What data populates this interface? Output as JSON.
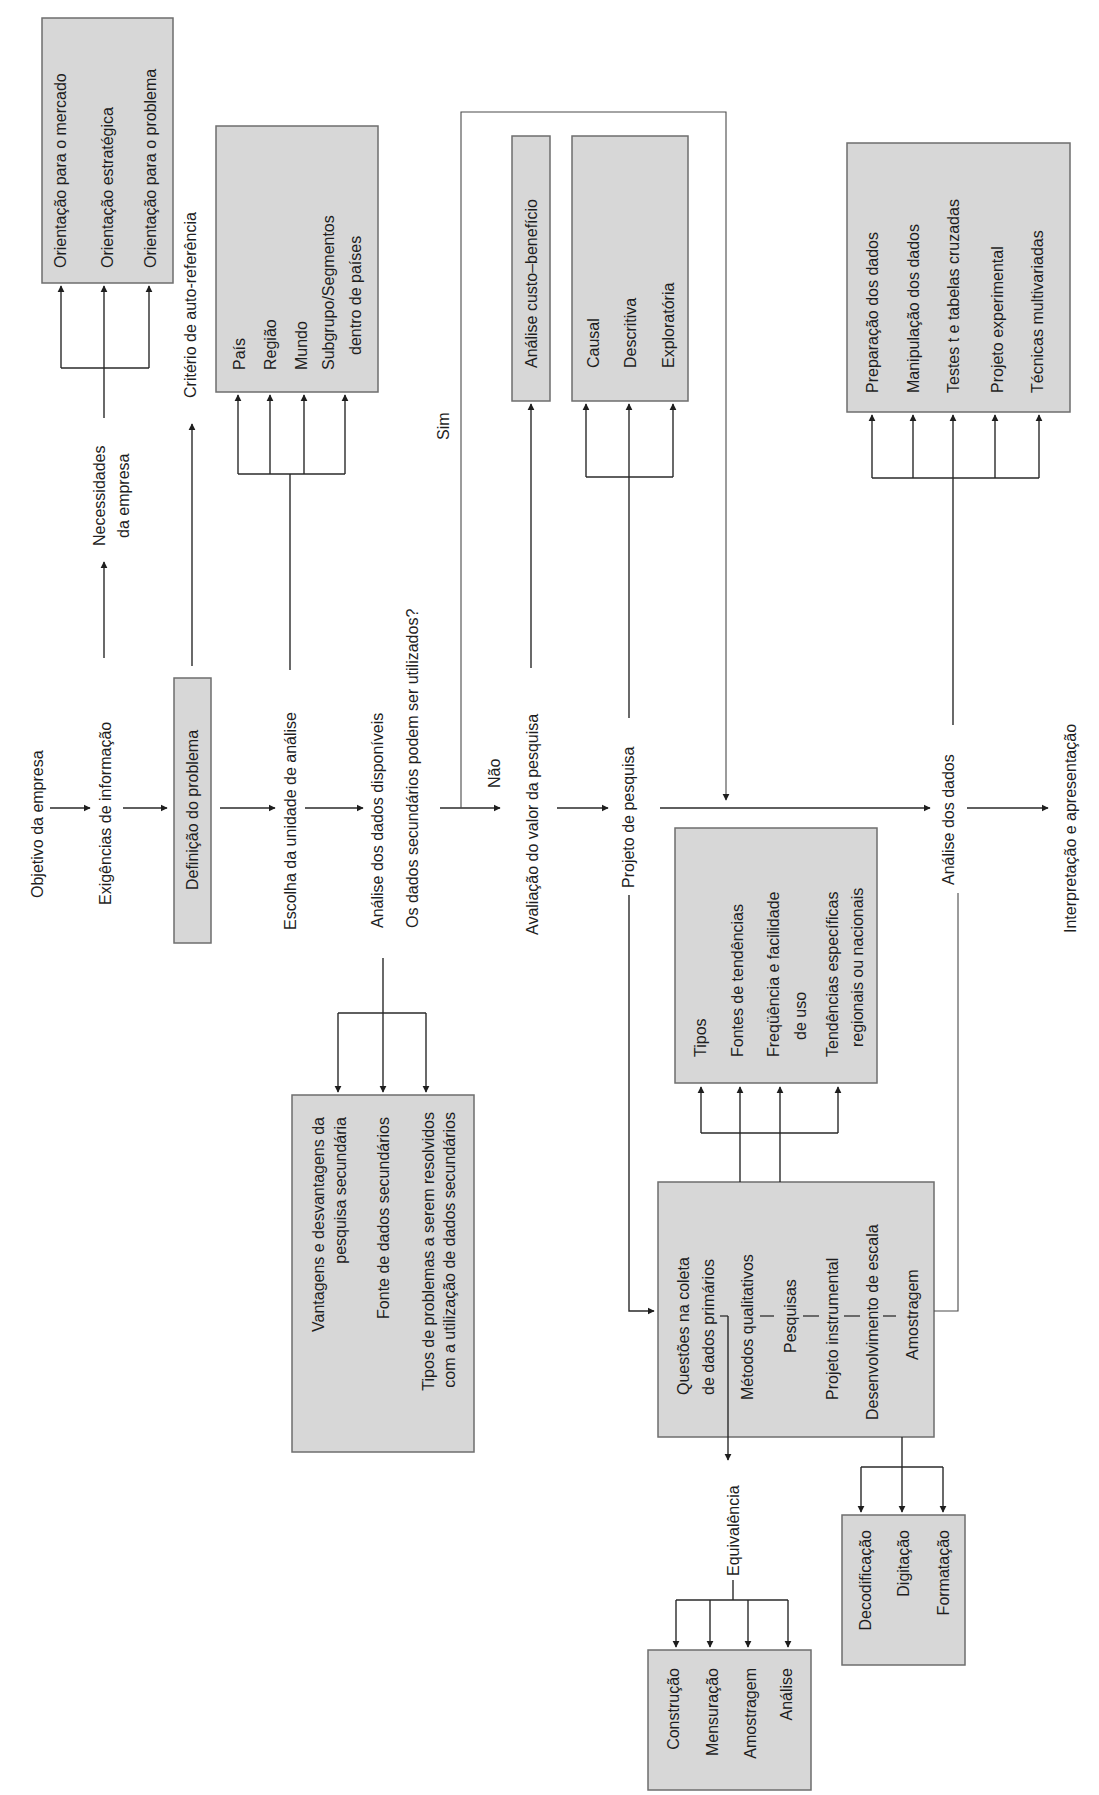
{
  "main_flow": {
    "objetivo": "Objetivo da empresa",
    "exigencias": "Exigências de informação",
    "definicao": "Definição do problema",
    "escolha": "Escolha da unidade de análise",
    "analise_disponiveis": "Análise dos dados disponíveis",
    "pergunta_secundarios": "Os dados secundários podem ser utilizados?",
    "nao": "Não",
    "sim": "Sim",
    "avaliacao": "Avaliação do valor da pesquisa",
    "projeto": "Projeto de pesquisa",
    "analise_dados": "Análise dos dados",
    "interpretacao": "Interpretação e apresentação"
  },
  "necessidades": {
    "label_line1": "Necessidades",
    "label_line2": "da empresa",
    "items": [
      "Orientação para o mercado",
      "Orientação estratégica",
      "Orientação para o problema"
    ]
  },
  "criterio": {
    "label": "Critério de auto-referência"
  },
  "unidade_analise": {
    "items": [
      "País",
      "Região",
      "Mundo",
      "Subgrupo/Segmentos",
      "dentro de países"
    ]
  },
  "dados_secundarios": {
    "items": [
      "Vantagens e desvantagens da",
      "pesquisa secundária",
      "Fonte de dados secundários",
      "Tipos de problemas a serem resolvidos",
      "com a utilização de dados secundários"
    ]
  },
  "avaliacao_box": {
    "items": [
      "Análise custo–benefício"
    ]
  },
  "tipos_pesquisa": {
    "items": [
      "Causal",
      "Descritiva",
      "Exploratória"
    ]
  },
  "tendencias": {
    "items": [
      "Tipos",
      "Fontes de tendências",
      "Freqüência e facilidade",
      "de uso",
      "Tendências específicas",
      "regionais ou nacionais"
    ]
  },
  "coleta_primarios": {
    "items": [
      "Questões na coleta",
      "de dados primários",
      "Métodos qualitativos",
      "Pesquisas",
      "Projeto instrumental",
      "Desenvolvimento de escala",
      "Amostragem"
    ]
  },
  "equivalencia": {
    "label": "Equivalência",
    "items": [
      "Construção",
      "Mensuração",
      "Amostragem",
      "Análise"
    ]
  },
  "preparacao": {
    "items": [
      "Decodificação",
      "Digitação",
      "Formatação"
    ]
  },
  "analise_box": {
    "items": [
      "Preparação dos dados",
      "Manipulação dos dados",
      "Testes t e tabelas cruzadas",
      "Projeto experimental",
      "Técnicas multivariadas"
    ]
  },
  "colors": {
    "box_fill": "#d7d7d7",
    "box_stroke": "#6e6e6e",
    "line": "#2a2a2a",
    "text": "#1e1e1e",
    "background": "#ffffff"
  }
}
